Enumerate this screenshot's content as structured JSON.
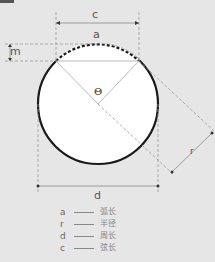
{
  "header": {
    "title_glyph": "图"
  },
  "labels": {
    "c": "c",
    "a": "a",
    "m": "m",
    "theta": "Θ",
    "r": "r",
    "d": "d"
  },
  "legend": [
    {
      "symbol": "a",
      "description": "弧长"
    },
    {
      "symbol": "r",
      "description": "半径"
    },
    {
      "symbol": "d",
      "description": "周长"
    },
    {
      "symbol": "c",
      "description": "弦长"
    }
  ],
  "colors": {
    "background": "#e6e6e6",
    "circle_fill": "#ffffff",
    "circle_stroke": "#1a1a1a",
    "guide": "#999999"
  }
}
